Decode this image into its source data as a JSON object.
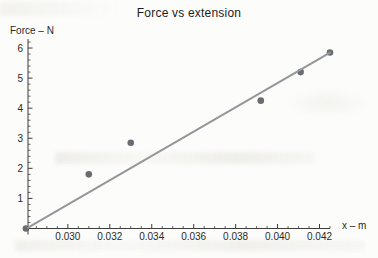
{
  "chart_data": {
    "type": "scatter",
    "title": "Force vs extension",
    "xlabel": "x – m",
    "ylabel": "Force – N",
    "series": [
      {
        "name": "measured data points",
        "type": "scatter",
        "points": [
          [
            0.028,
            0.0
          ],
          [
            0.031,
            1.8
          ],
          [
            0.033,
            2.85
          ],
          [
            0.0392,
            4.25
          ],
          [
            0.0411,
            5.2
          ],
          [
            0.0425,
            5.85
          ]
        ]
      },
      {
        "name": "line of best fit",
        "type": "line",
        "points": [
          [
            0.0281,
            0.03
          ],
          [
            0.0425,
            5.85
          ]
        ]
      }
    ],
    "x_ticks": {
      "values": [
        0.03,
        0.032,
        0.034,
        0.036,
        0.038,
        0.04,
        0.042
      ],
      "labels": [
        "0.030",
        "0.032",
        "0.034",
        "0.036",
        "0.038",
        "0.040",
        "0.042"
      ]
    },
    "y_ticks": {
      "values": [
        1,
        2,
        3,
        4,
        5,
        6
      ],
      "labels": [
        "1",
        "2",
        "3",
        "4",
        "5",
        "6"
      ]
    },
    "x_minor_step": 0.0005,
    "y_minor_step": 0.2,
    "xlim": [
      0.0281,
      0.0425
    ],
    "ylim": [
      0,
      6.3
    ],
    "grid": false,
    "legend": null,
    "colors": {
      "point": "#5d6064",
      "fit_line": "#94979a",
      "axis": "#3d3d3d",
      "tick_text": "#2a2a2a",
      "title_text": "#1c1c1c",
      "background": "#fcfcfa"
    }
  }
}
